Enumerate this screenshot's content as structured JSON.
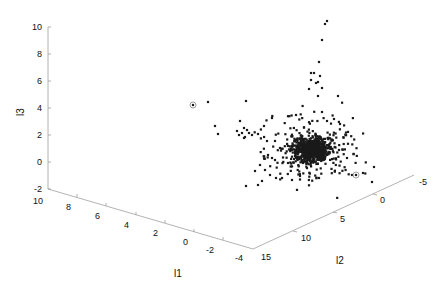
{
  "chart_data": {
    "type": "scatter",
    "projection": "3d",
    "title": "",
    "xlabel": "l1",
    "ylabel": "l2",
    "zlabel": "l3",
    "xlim": [
      -4,
      10
    ],
    "ylim": [
      -5,
      15
    ],
    "zlim": [
      -2,
      10
    ],
    "x_ticks": [
      "10",
      "8",
      "6",
      "4",
      "2",
      "0",
      "-2",
      "-4"
    ],
    "y_ticks": [
      "15",
      "10",
      "5",
      "0",
      "-5"
    ],
    "z_ticks": [
      "10",
      "8",
      "6",
      "4",
      "2",
      "0",
      "-2"
    ],
    "grid": false,
    "legend": null,
    "marker_color": "#1a1a1a",
    "axis_color": "#9a9a9a",
    "cluster": {
      "center_px": [
        311,
        150
      ],
      "count": 900,
      "spread_px": [
        14,
        10
      ]
    },
    "outliers_px": [
      [
        327,
        21
      ],
      [
        325,
        24
      ],
      [
        322,
        40
      ],
      [
        319,
        62
      ],
      [
        311,
        73
      ],
      [
        314,
        73
      ],
      [
        320,
        76
      ],
      [
        318,
        82
      ],
      [
        311,
        80
      ],
      [
        316,
        83
      ],
      [
        322,
        88
      ],
      [
        309,
        89
      ],
      [
        318,
        96
      ],
      [
        338,
        96
      ],
      [
        193,
        105
      ],
      [
        208,
        102
      ],
      [
        246,
        101
      ],
      [
        215,
        126
      ],
      [
        218,
        134
      ],
      [
        240,
        121
      ],
      [
        244,
        128
      ],
      [
        237,
        131
      ],
      [
        247,
        130
      ],
      [
        242,
        133
      ],
      [
        249,
        133
      ],
      [
        245,
        137
      ],
      [
        252,
        135
      ],
      [
        239,
        135
      ],
      [
        244,
        138
      ],
      [
        258,
        134
      ],
      [
        267,
        141
      ],
      [
        275,
        141
      ],
      [
        280,
        148
      ],
      [
        268,
        155
      ],
      [
        272,
        158
      ],
      [
        275,
        160
      ],
      [
        260,
        165
      ],
      [
        265,
        170
      ],
      [
        255,
        171
      ],
      [
        270,
        175
      ],
      [
        276,
        178
      ],
      [
        282,
        178
      ],
      [
        292,
        180
      ],
      [
        300,
        176
      ],
      [
        319,
        178
      ],
      [
        246,
        186
      ],
      [
        258,
        185
      ],
      [
        262,
        181
      ],
      [
        288,
        163
      ],
      [
        301,
        158
      ],
      [
        339,
        150
      ],
      [
        347,
        158
      ],
      [
        352,
        175
      ],
      [
        356,
        175
      ],
      [
        363,
        173
      ],
      [
        372,
        182
      ],
      [
        374,
        167
      ],
      [
        264,
        126
      ],
      [
        272,
        118
      ],
      [
        296,
        115
      ],
      [
        322,
        112
      ],
      [
        334,
        119
      ],
      [
        340,
        124
      ]
    ],
    "highlighted_px": [
      [
        193,
        105
      ],
      [
        356,
        175
      ]
    ]
  }
}
